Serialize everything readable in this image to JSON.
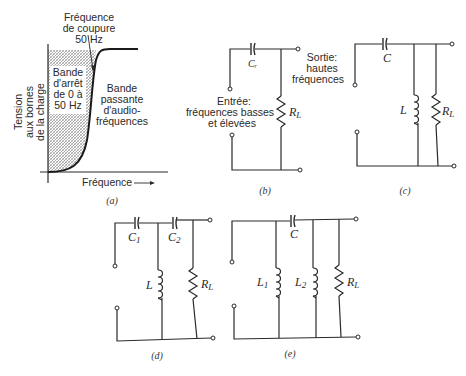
{
  "figure_a": {
    "title_lines": [
      "Fréquence",
      "de coupure",
      "50 Hz"
    ],
    "y_axis_lines": [
      "Tension",
      "aux bornes",
      "de la charge"
    ],
    "x_axis_label": "Fréquence",
    "x_axis_arrow": "→",
    "stop_band_lines": [
      "Bande",
      "d'arrêt",
      "de 0 à",
      "50 Hz"
    ],
    "pass_band_lines": [
      "Bande",
      "passante",
      "d'audio-",
      "fréquences"
    ],
    "caption": "(a)"
  },
  "figure_b": {
    "capacitor_label": "Cᵣ",
    "input_lines": [
      "Entrée:",
      "fréquences basses",
      "et élevées"
    ],
    "output_lines": [
      "Sortie:",
      "hautes",
      "fréquences"
    ],
    "resistor_label": "R",
    "resistor_sub": "L",
    "caption": "(b)"
  },
  "figure_c": {
    "capacitor_label": "C",
    "inductor_label": "L",
    "resistor_label": "R",
    "resistor_sub": "L",
    "caption": "(c)"
  },
  "figure_d": {
    "capacitor1_label": "C",
    "capacitor1_sub": "1",
    "capacitor2_label": "C",
    "capacitor2_sub": "2",
    "inductor_label": "L",
    "resistor_label": "R",
    "resistor_sub": "L",
    "caption": "(d)"
  },
  "figure_e": {
    "capacitor_label": "C",
    "inductor1_label": "L",
    "inductor1_sub": "1",
    "inductor2_label": "L",
    "inductor2_sub": "2",
    "resistor_label": "R",
    "resistor_sub": "L",
    "caption": "(e)"
  }
}
